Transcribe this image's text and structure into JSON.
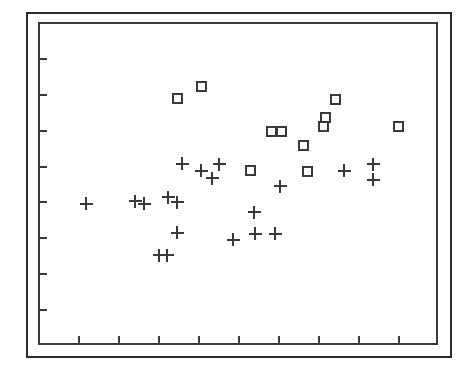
{
  "figure": {
    "background_color": "#ffffff",
    "ink_color": "#3a3a3a",
    "frame_color": "#2b2b2b"
  },
  "chart_data": {
    "type": "scatter",
    "title": "",
    "subtitle": "",
    "xlabel": "",
    "ylabel": "",
    "xlim": [
      0,
      10
    ],
    "ylim": [
      0,
      9
    ],
    "grid": false,
    "legend_position": "none",
    "xticks": [
      1,
      2,
      3,
      4,
      5,
      6,
      7,
      8,
      9
    ],
    "xticklabels": [
      "",
      "",
      "",
      "",
      "",
      "",
      "",
      "",
      ""
    ],
    "yticks": [
      1,
      2,
      3,
      4,
      5,
      6,
      7,
      8
    ],
    "yticklabels": [
      "",
      "",
      "",
      "",
      "",
      "",
      "",
      ""
    ],
    "series": [
      {
        "name": "plus-series",
        "marker": "plus",
        "color": "#3a3a3a",
        "points": [
          {
            "x": 1.2,
            "y": 3.93
          },
          {
            "x": 2.43,
            "y": 4.0
          },
          {
            "x": 2.65,
            "y": 3.93
          },
          {
            "x": 3.25,
            "y": 4.11
          },
          {
            "x": 3.48,
            "y": 3.98
          },
          {
            "x": 3.48,
            "y": 3.13
          },
          {
            "x": 3.03,
            "y": 2.5
          },
          {
            "x": 3.23,
            "y": 2.5
          },
          {
            "x": 3.6,
            "y": 5.05
          },
          {
            "x": 4.08,
            "y": 4.85
          },
          {
            "x": 4.35,
            "y": 4.65
          },
          {
            "x": 4.53,
            "y": 5.03
          },
          {
            "x": 4.88,
            "y": 2.93
          },
          {
            "x": 5.4,
            "y": 3.7
          },
          {
            "x": 5.43,
            "y": 3.1
          },
          {
            "x": 5.93,
            "y": 3.1
          },
          {
            "x": 6.05,
            "y": 4.43
          },
          {
            "x": 7.65,
            "y": 4.85
          },
          {
            "x": 8.38,
            "y": 5.03
          },
          {
            "x": 8.38,
            "y": 4.6
          }
        ]
      },
      {
        "name": "square-series",
        "marker": "open-square",
        "color": "#3a3a3a",
        "points": [
          {
            "x": 3.48,
            "y": 6.88
          },
          {
            "x": 4.08,
            "y": 7.2
          },
          {
            "x": 5.83,
            "y": 5.95
          },
          {
            "x": 6.08,
            "y": 5.95
          },
          {
            "x": 6.63,
            "y": 5.57
          },
          {
            "x": 7.13,
            "y": 6.1
          },
          {
            "x": 7.18,
            "y": 6.33
          },
          {
            "x": 7.43,
            "y": 6.83
          },
          {
            "x": 5.3,
            "y": 4.85
          },
          {
            "x": 6.73,
            "y": 4.83
          },
          {
            "x": 9.0,
            "y": 6.08
          }
        ]
      }
    ]
  },
  "axes": {
    "plot_left_px": 38,
    "plot_top_px": 22,
    "plot_width_px": 400,
    "plot_height_px": 323
  }
}
